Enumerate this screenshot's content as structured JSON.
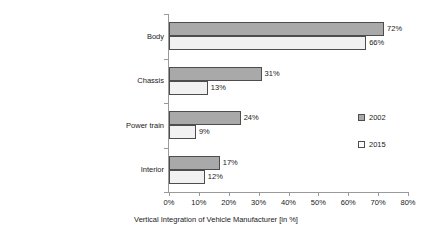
{
  "chart_data": {
    "type": "bar",
    "orientation": "horizontal",
    "title": "",
    "xlabel": "Vertical Integration of Vehicle Manufacturer [in %]",
    "ylabel": "",
    "xlim": [
      0,
      80
    ],
    "xticks": [
      "0%",
      "10%",
      "20%",
      "30%",
      "40%",
      "50%",
      "60%",
      "70%",
      "80%"
    ],
    "xtick_values": [
      0,
      10,
      20,
      30,
      40,
      50,
      60,
      70,
      80
    ],
    "grid": false,
    "legend_position": "right",
    "categories": [
      "Body",
      "Chassis",
      "Power train",
      "Interior"
    ],
    "series": [
      {
        "name": "2002",
        "color": "#a9a9a9",
        "values": [
          72,
          31,
          24,
          17
        ],
        "labels": [
          "72%",
          "31%",
          "24%",
          "17%"
        ]
      },
      {
        "name": "2015",
        "color": "#f1f1f1",
        "values": [
          66,
          13,
          9,
          12
        ],
        "labels": [
          "66%",
          "13%",
          "9%",
          "12%"
        ]
      }
    ]
  },
  "legend": {
    "items": [
      {
        "label": "2002",
        "swatch": "#a9a9a9"
      },
      {
        "label": "2015",
        "swatch": "#ffffff"
      }
    ]
  },
  "axis": {
    "line_color": "#9a9a9a",
    "bar_border_color": "#4d4d4d"
  }
}
